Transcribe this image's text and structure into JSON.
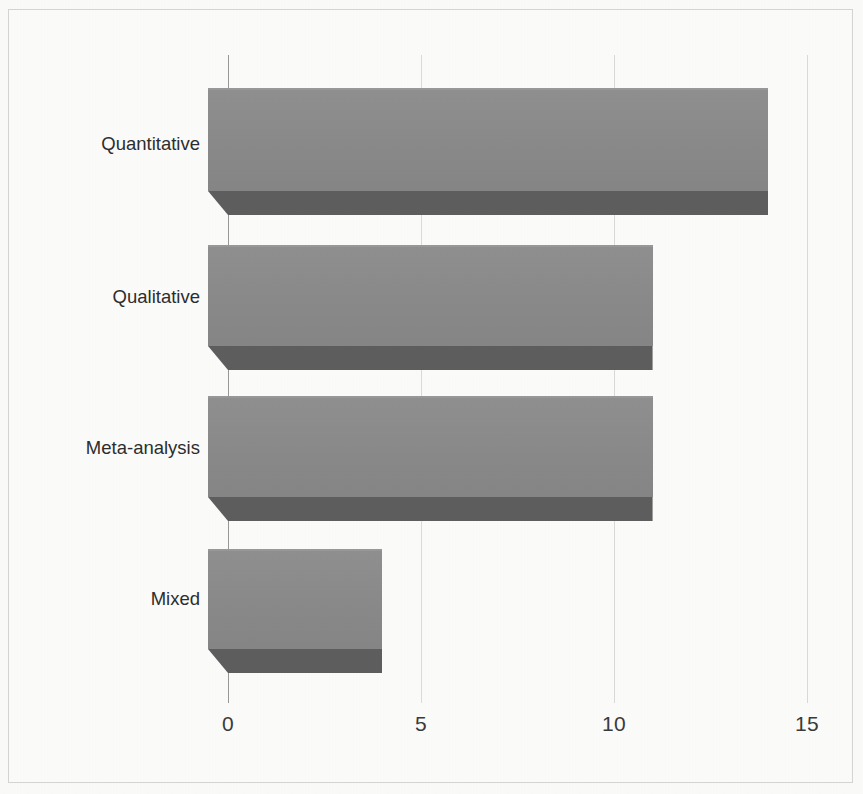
{
  "chart_data": {
    "type": "bar",
    "orientation": "horizontal",
    "style": "3d",
    "title": "",
    "subtitle": "",
    "xlabel": "",
    "ylabel": "",
    "categories": [
      "Quantitative",
      "Qualitative",
      "Meta-analysis",
      "Mixed"
    ],
    "values": [
      14,
      11,
      11,
      4
    ],
    "series": [
      {
        "name": "",
        "values": [
          14,
          11,
          11,
          4
        ]
      }
    ],
    "xlim": [
      0,
      15
    ],
    "ylim": null,
    "x_ticks": [
      0,
      5,
      10,
      15
    ],
    "x_tick_labels": [
      "0",
      "5",
      "10",
      "15"
    ],
    "y_tick_labels": [
      "Quantitative",
      "Qualitative",
      "Meta-analysis",
      "Mixed"
    ],
    "grid": "vertical",
    "legend": "none",
    "legend_position": "none",
    "annotations": [],
    "data_labels": false,
    "colors": {
      "bar_front": "#8d8d8d",
      "bar_top": "#9a9a9a",
      "bar_shadow": "#5f5f5f",
      "gridline": "#dcdcda",
      "axis": "#9a9a98",
      "text": "#2e2e2e",
      "background": "#fefefd",
      "frame_border": "#d7d7d4"
    }
  },
  "axis": {
    "x_ticks": [
      {
        "label": "0",
        "value": 0
      },
      {
        "label": "5",
        "value": 5
      },
      {
        "label": "10",
        "value": 10
      },
      {
        "label": "15",
        "value": 15
      }
    ]
  },
  "bars": [
    {
      "label": "Quantitative",
      "value": 14
    },
    {
      "label": "Qualitative",
      "value": 11
    },
    {
      "label": "Meta-analysis",
      "value": 11
    },
    {
      "label": "Mixed",
      "value": 4
    }
  ]
}
